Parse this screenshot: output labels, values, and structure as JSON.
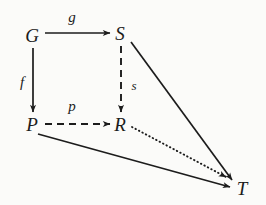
{
  "figure": {
    "kind": "commutative-diagram",
    "background_color": "#fbfbf9",
    "ink_color": "#1c1c1c",
    "width": 266,
    "height": 205
  },
  "nodes": [
    {
      "id": "G",
      "label": "G",
      "x": 32,
      "y": 35
    },
    {
      "id": "S",
      "label": "S",
      "x": 120,
      "y": 33
    },
    {
      "id": "P",
      "label": "P",
      "x": 32,
      "y": 124
    },
    {
      "id": "R",
      "label": "R",
      "x": 120,
      "y": 124
    },
    {
      "id": "T",
      "label": "T",
      "x": 242,
      "y": 188
    }
  ],
  "edges": [
    {
      "id": "g",
      "from": "G",
      "to": "S",
      "style": "solid",
      "label": "g",
      "label_x": 72,
      "label_y": 17
    },
    {
      "id": "f",
      "from": "G",
      "to": "P",
      "style": "solid",
      "label": "f",
      "label_x": 22,
      "label_y": 82
    },
    {
      "id": "p",
      "from": "P",
      "to": "R",
      "style": "dashed",
      "label": "p",
      "label_x": 72,
      "label_y": 106
    },
    {
      "id": "s",
      "from": "S",
      "to": "R",
      "style": "dashed",
      "label": "s",
      "label_x": 134,
      "label_y": 85
    },
    {
      "id": "s-to-t",
      "from": "S",
      "to": "T",
      "style": "solid",
      "label": "",
      "label_x": 0,
      "label_y": 0
    },
    {
      "id": "p-to-t",
      "from": "P",
      "to": "T",
      "style": "solid",
      "label": "",
      "label_x": 0,
      "label_y": 0
    },
    {
      "id": "r-to-t",
      "from": "R",
      "to": "T",
      "style": "dotted",
      "label": "",
      "label_x": 0,
      "label_y": 0
    }
  ]
}
